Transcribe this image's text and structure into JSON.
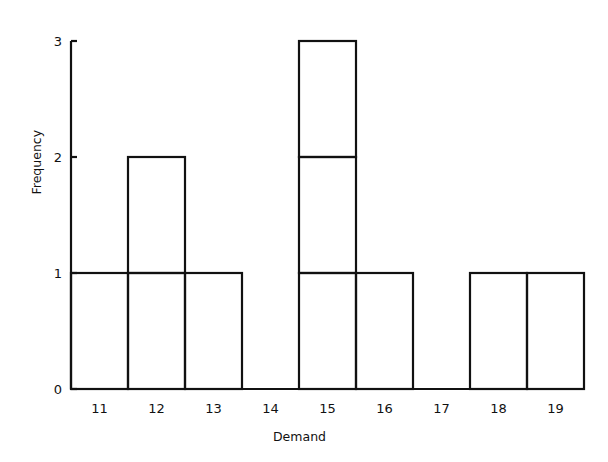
{
  "chart_data": {
    "type": "bar",
    "subtype": "histogram-stacked-unit-boxes",
    "title": "",
    "xlabel": "Demand",
    "ylabel": "Frequency",
    "categories": [
      "11",
      "12",
      "13",
      "14",
      "15",
      "16",
      "17",
      "18",
      "19"
    ],
    "values": [
      1,
      2,
      1,
      0,
      3,
      1,
      0,
      1,
      1
    ],
    "ylim": [
      0,
      3
    ],
    "y_ticks": [
      "0",
      "1",
      "2",
      "3"
    ],
    "grid": false,
    "legend": null,
    "stroke_color": "#111111",
    "background_color": "#ffffff"
  },
  "layout": {
    "origin_x": 71,
    "origin_y": 389,
    "bin_width": 57,
    "unit_height": 116
  }
}
